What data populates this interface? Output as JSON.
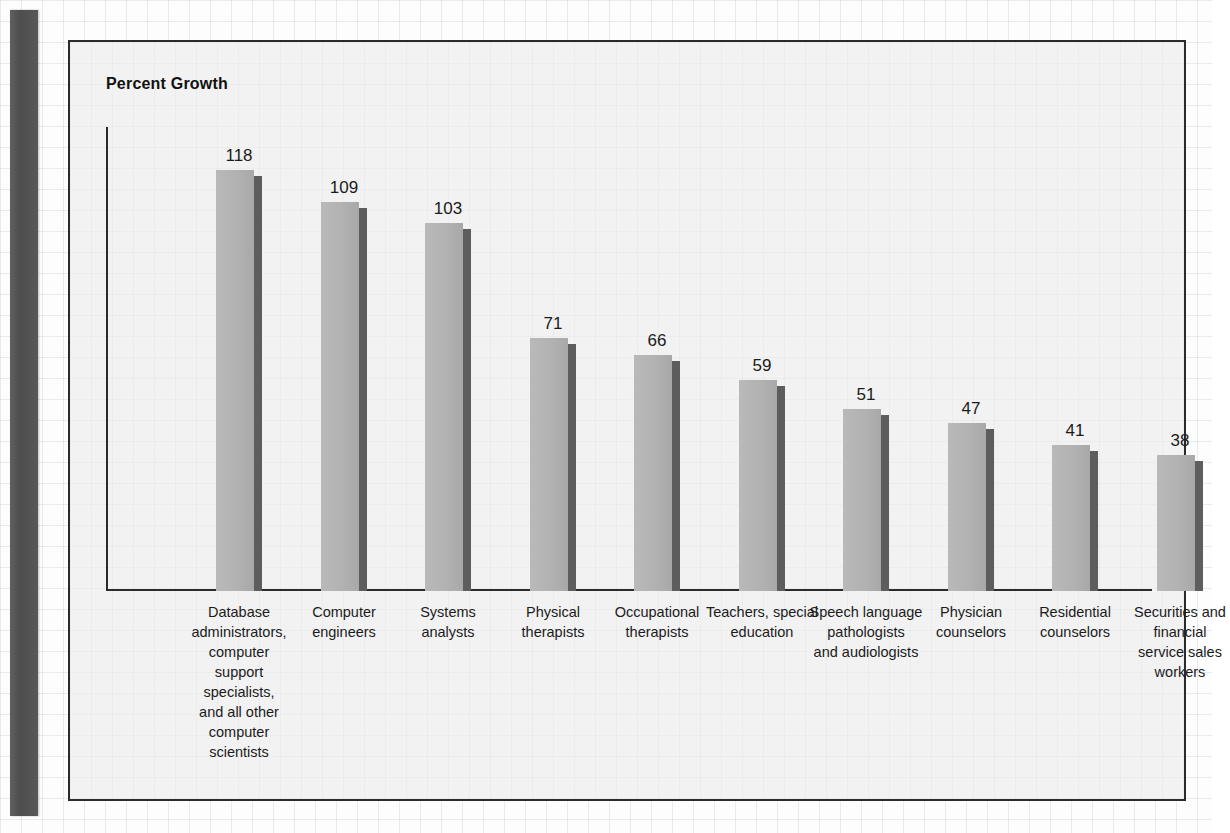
{
  "chart_data": {
    "type": "bar",
    "title": "Percent Growth",
    "xlabel": "",
    "ylabel": "Percent Growth",
    "ylim": [
      0,
      130
    ],
    "grid": false,
    "legend": "none",
    "orientation": "vertical",
    "categories": [
      "Database administrators, computer support specialists, and all other computer scientists",
      "Computer engineers",
      "Systems analysts",
      "Physical therapists",
      "Occupational therapists",
      "Teachers, special education",
      "Speech language pathologists and audiologists",
      "Physician counselors",
      "Residential counselors",
      "Securities and financial service sales workers"
    ],
    "category_lines": [
      [
        "Database",
        "administrators,",
        "computer",
        "support specialists,",
        "and all other",
        "computer scientists"
      ],
      [
        "Computer",
        "engineers"
      ],
      [
        "Systems",
        "analysts"
      ],
      [
        "Physical",
        "therapists"
      ],
      [
        "Occupational",
        "therapists"
      ],
      [
        "Teachers, special",
        "education"
      ],
      [
        "Speech language",
        "pathologists",
        "and audiologists"
      ],
      [
        "Physician",
        "counselors"
      ],
      [
        "Residential",
        "counselors"
      ],
      [
        "Securities and",
        "financial",
        "service sales",
        "workers"
      ]
    ],
    "values": [
      118,
      109,
      103,
      71,
      66,
      59,
      51,
      47,
      41,
      38
    ],
    "value_labels": [
      "118",
      "109",
      "103",
      "71",
      "66",
      "59",
      "51",
      "47",
      "41",
      "38"
    ]
  },
  "style": {
    "bar_face_color": "#b2b2b2",
    "bar_side_color": "#5d5d5d",
    "axis_color": "#2b2b2b",
    "panel_background": "#f2f2f2",
    "panel_border_color": "#2b2b2b",
    "page_background": "#fdfdfd",
    "spine_color": "#545454",
    "text_color": "#1b1b1b"
  }
}
